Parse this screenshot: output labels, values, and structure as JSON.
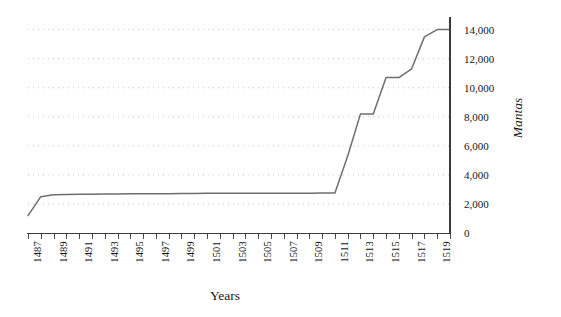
{
  "chart_data": {
    "type": "line",
    "title": "",
    "xlabel": "Years",
    "ylabel": "Mantas",
    "x": [
      1487,
      1488,
      1489,
      1490,
      1491,
      1492,
      1493,
      1494,
      1495,
      1496,
      1497,
      1498,
      1499,
      1500,
      1501,
      1502,
      1503,
      1504,
      1505,
      1506,
      1507,
      1508,
      1509,
      1510,
      1511,
      1512,
      1513,
      1514,
      1515,
      1516,
      1517,
      1518,
      1519,
      1520
    ],
    "values": [
      1200,
      2500,
      2640,
      2650,
      2660,
      2670,
      2680,
      2690,
      2700,
      2700,
      2710,
      2710,
      2720,
      2720,
      2730,
      2730,
      2730,
      2740,
      2740,
      2740,
      2740,
      2740,
      2740,
      2750,
      2750,
      5300,
      8200,
      8200,
      10700,
      10700,
      11300,
      13500,
      14000,
      14000
    ],
    "xlim": [
      1487,
      1520
    ],
    "ylim": [
      0,
      14800
    ],
    "yticks": [
      0,
      2000,
      4000,
      6000,
      8000,
      10000,
      12000,
      14000
    ],
    "ytick_labels": [
      "0",
      "2,000",
      "4,000",
      "6,000",
      "8,000",
      "10,000",
      "12,000",
      "14,000"
    ],
    "xticks": [
      1487,
      1488,
      1489,
      1490,
      1491,
      1492,
      1493,
      1494,
      1495,
      1496,
      1497,
      1498,
      1499,
      1500,
      1501,
      1502,
      1503,
      1504,
      1505,
      1506,
      1507,
      1508,
      1509,
      1510,
      1511,
      1512,
      1513,
      1514,
      1515,
      1516,
      1517,
      1518,
      1519,
      1520
    ],
    "xtick_labels": [
      "1487",
      "",
      "1489",
      "",
      "1491",
      "",
      "1493",
      "",
      "1495",
      "",
      "1497",
      "",
      "1499",
      "",
      "1501",
      "",
      "1503",
      "",
      "1505",
      "",
      "1507",
      "",
      "1509",
      "",
      "1511",
      "",
      "1513",
      "",
      "1515",
      "",
      "1517",
      "",
      "1519",
      ""
    ],
    "grid": "horizontal-dotted",
    "legend": "none",
    "series_color": "#6e6e6e",
    "axis_color": "#3a3a3a",
    "grid_color": "#9aa3bb",
    "background": "#ffffff"
  }
}
